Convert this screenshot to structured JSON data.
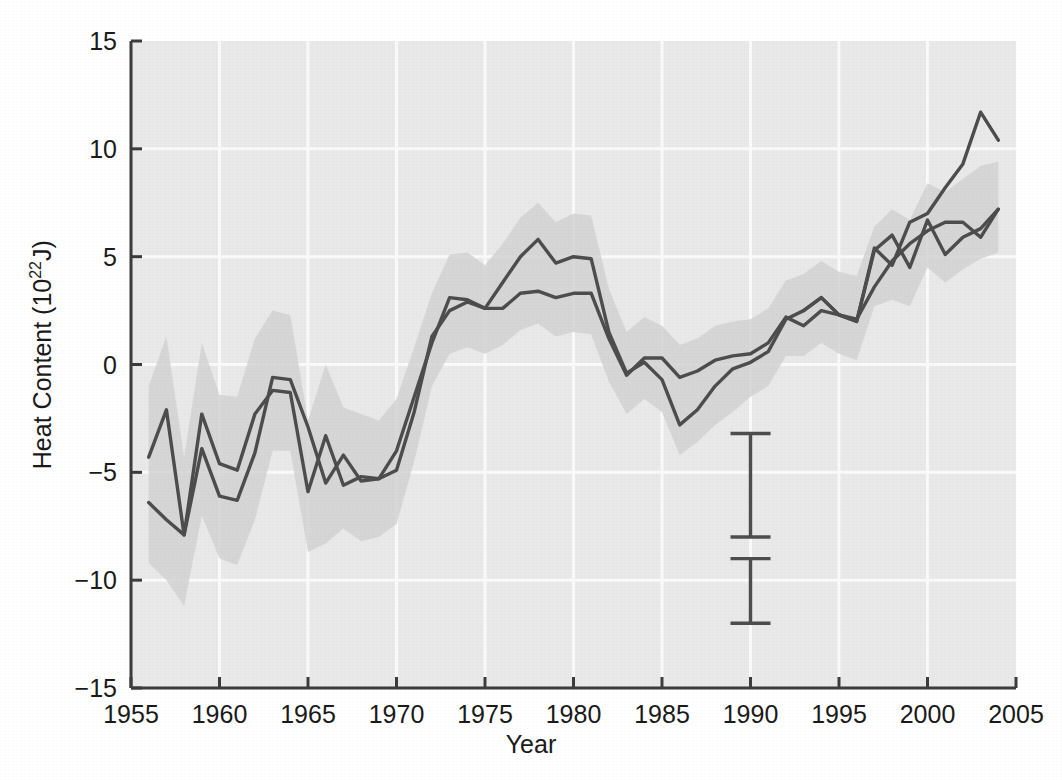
{
  "chart_data": {
    "type": "line",
    "title": "",
    "xlabel": "Year",
    "ylabel_text": "Heat Content (10",
    "ylabel_sup": "22",
    "ylabel_tail": "J)",
    "ylabel_full": "Heat Content (10^22 J)",
    "xlim": [
      1955,
      2005
    ],
    "ylim": [
      -15,
      15
    ],
    "grid": true,
    "legend_position": "none",
    "xticks": [
      1955,
      1960,
      1965,
      1970,
      1975,
      1980,
      1985,
      1990,
      1995,
      2000,
      2005
    ],
    "xtick_labels": [
      "1955",
      "1960",
      "1965",
      "1970",
      "1975",
      "1980",
      "1985",
      "1990",
      "1995",
      "2000",
      "2005"
    ],
    "yticks": [
      -15,
      -10,
      -5,
      0,
      5,
      10,
      15
    ],
    "ytick_labels": [
      "−15",
      "−10",
      "−5",
      "0",
      "5",
      "10",
      "15"
    ],
    "line_color": "#4d4d4d",
    "band_color": "#d2d2d2",
    "plot_bg_color": "#e9e9e9",
    "gridline_color": "#fafafa",
    "axis_color": "#3c3c3c",
    "series": [
      {
        "name": "series-a",
        "x": [
          1956,
          1957,
          1958,
          1959,
          1960,
          1961,
          1962,
          1963,
          1964,
          1965,
          1966,
          1967,
          1968,
          1969,
          1970,
          1971,
          1972,
          1973,
          1974,
          1975,
          1976,
          1977,
          1978,
          1979,
          1980,
          1981,
          1982,
          1983,
          1984,
          1985,
          1986,
          1987,
          1988,
          1989,
          1990,
          1991,
          1992,
          1993,
          1994,
          1995,
          1996,
          1997,
          1998,
          1999,
          2000,
          2001,
          2002,
          2003,
          2004
        ],
        "values": [
          -4.3,
          -2.1,
          -7.9,
          -2.3,
          -4.6,
          -4.9,
          -2.3,
          -1.2,
          -1.3,
          -5.9,
          -3.3,
          -5.6,
          -5.2,
          -5.3,
          -4.0,
          -1.5,
          1.0,
          3.1,
          3.0,
          2.6,
          2.6,
          3.3,
          3.4,
          3.1,
          3.3,
          3.3,
          1.2,
          -0.5,
          0.3,
          0.3,
          -0.6,
          -0.3,
          0.2,
          0.4,
          0.5,
          1.0,
          2.2,
          1.8,
          2.5,
          2.3,
          2.1,
          3.6,
          4.8,
          5.6,
          6.2,
          6.6,
          6.6,
          5.9,
          7.2
        ]
      },
      {
        "name": "series-b",
        "x": [
          1956,
          1957,
          1958,
          1959,
          1960,
          1961,
          1962,
          1963,
          1964,
          1965,
          1966,
          1967,
          1968,
          1969,
          1970,
          1971,
          1972,
          1973,
          1974,
          1975,
          1976,
          1977,
          1978,
          1979,
          1980,
          1981,
          1982,
          1983,
          1984,
          1985,
          1986,
          1987,
          1988,
          1989,
          1990,
          1991,
          1992,
          1993,
          1994,
          1995,
          1996,
          1997,
          1998,
          1999,
          2000,
          2001,
          2002,
          2003,
          2004
        ],
        "values": [
          -6.4,
          -7.2,
          -7.9,
          -3.9,
          -6.1,
          -6.3,
          -4.1,
          -0.6,
          -0.7,
          -2.9,
          -5.5,
          -4.2,
          -5.4,
          -5.3,
          -4.9,
          -2.2,
          1.3,
          2.5,
          2.9,
          2.6,
          3.8,
          5.0,
          5.8,
          4.7,
          5.0,
          4.9,
          1.5,
          -0.4,
          0.1,
          -0.7,
          -2.8,
          -2.1,
          -1.0,
          -0.2,
          0.1,
          0.6,
          2.1,
          2.5,
          3.1,
          2.3,
          2.0,
          5.3,
          6.0,
          4.5,
          6.7,
          5.1,
          5.9,
          6.3,
          7.2
        ]
      },
      {
        "name": "series-c",
        "x": [
          1993,
          1994,
          1995,
          1996,
          1997,
          1998,
          1999,
          2000,
          2001,
          2002,
          2003,
          2004
        ],
        "values": [
          2.5,
          3.1,
          2.3,
          2.0,
          5.4,
          4.6,
          6.6,
          7.0,
          8.2,
          9.3,
          11.7,
          10.4
        ]
      }
    ],
    "uncertainty_bands": [
      {
        "name": "band-a",
        "x": [
          1956,
          1957,
          1958,
          1959,
          1960,
          1961,
          1962,
          1963,
          1964,
          1965,
          1966,
          1967,
          1968,
          1969,
          1970,
          1971,
          1972,
          1973,
          1974,
          1975,
          1976,
          1977,
          1978,
          1979,
          1980,
          1981,
          1982,
          1983,
          1984,
          1985,
          1986,
          1987,
          1988,
          1989,
          1990,
          1991,
          1992,
          1993,
          1994,
          1995,
          1996,
          1997,
          1998,
          1999,
          2000,
          2001,
          2002,
          2003,
          2004
        ],
        "upper": [
          -1.0,
          1.3,
          -4.3,
          1.0,
          -1.4,
          -1.5,
          1.2,
          2.5,
          2.3,
          -2.6,
          0.0,
          -2.0,
          -2.3,
          -2.6,
          -1.6,
          0.8,
          3.3,
          5.1,
          5.2,
          4.6,
          5.6,
          6.8,
          7.5,
          6.6,
          7.0,
          6.9,
          3.5,
          1.5,
          2.2,
          1.8,
          0.9,
          1.2,
          1.8,
          2.0,
          2.1,
          2.6,
          3.9,
          4.2,
          4.8,
          4.3,
          4.1,
          6.4,
          7.2,
          6.7,
          8.4,
          8.0,
          8.6,
          9.2,
          9.4
        ],
        "lower": [
          -9.2,
          -10.0,
          -11.2,
          -7.0,
          -9.0,
          -9.3,
          -7.2,
          -4.0,
          -4.0,
          -8.7,
          -8.3,
          -7.6,
          -8.2,
          -8.0,
          -7.4,
          -4.5,
          -1.0,
          0.5,
          0.8,
          0.5,
          0.9,
          1.6,
          1.9,
          1.3,
          1.5,
          1.4,
          -0.8,
          -2.3,
          -1.6,
          -2.2,
          -4.2,
          -3.6,
          -2.8,
          -2.2,
          -1.5,
          -1.0,
          0.4,
          0.4,
          1.0,
          0.5,
          0.2,
          2.7,
          3.0,
          2.7,
          4.5,
          3.8,
          4.4,
          4.9,
          5.2
        ]
      }
    ],
    "error_bars": [
      {
        "name": "error-bar-upper",
        "x": 1990,
        "low": -8.0,
        "high": -3.2
      },
      {
        "name": "error-bar-lower",
        "x": 1990,
        "low": -12.0,
        "high": -9.0
      }
    ]
  }
}
